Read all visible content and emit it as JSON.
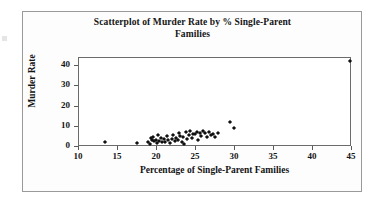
{
  "figure": {
    "background_color": "#ffffff",
    "frame_color": "#9a9a9a",
    "marker_color": "#111111"
  },
  "chart_data": {
    "type": "scatter",
    "title": "Scatterplot of Murder Rate by % Single-Parent Families",
    "title_line1": "Scatterplot of Murder Rate by % Single-Parent",
    "title_line2": "Families",
    "xlabel": "Percentage of Single-Parent Families",
    "ylabel": "Murder Rate",
    "xlim": [
      10,
      45
    ],
    "ylim": [
      0,
      44
    ],
    "xticks": [
      10,
      15,
      20,
      25,
      30,
      35,
      40,
      45
    ],
    "xtick_labels": [
      "10",
      "15",
      "20",
      "25",
      "30",
      "35",
      "40",
      "45"
    ],
    "yticks": [
      0,
      10,
      20,
      30,
      40
    ],
    "ytick_labels": [
      "0",
      "10",
      "20",
      "30",
      "40"
    ],
    "grid": false,
    "legend": false,
    "marker": "diamond",
    "n_points": 51,
    "points": [
      {
        "x": 13.5,
        "y": 1.8
      },
      {
        "x": 17.6,
        "y": 1.3
      },
      {
        "x": 19.0,
        "y": 2.0
      },
      {
        "x": 19.2,
        "y": 1.0
      },
      {
        "x": 19.3,
        "y": 3.8
      },
      {
        "x": 19.5,
        "y": 2.9
      },
      {
        "x": 19.6,
        "y": 4.4
      },
      {
        "x": 19.8,
        "y": 2.3
      },
      {
        "x": 20.0,
        "y": 3.1
      },
      {
        "x": 20.1,
        "y": 1.6
      },
      {
        "x": 20.3,
        "y": 5.6
      },
      {
        "x": 20.4,
        "y": 2.6
      },
      {
        "x": 20.6,
        "y": 4.0
      },
      {
        "x": 20.8,
        "y": 1.9
      },
      {
        "x": 21.0,
        "y": 3.4
      },
      {
        "x": 21.2,
        "y": 2.2
      },
      {
        "x": 21.4,
        "y": 4.8
      },
      {
        "x": 21.6,
        "y": 2.8
      },
      {
        "x": 21.8,
        "y": 1.7
      },
      {
        "x": 22.0,
        "y": 3.6
      },
      {
        "x": 22.2,
        "y": 5.2
      },
      {
        "x": 22.4,
        "y": 2.4
      },
      {
        "x": 22.6,
        "y": 4.2
      },
      {
        "x": 22.8,
        "y": 3.0
      },
      {
        "x": 23.0,
        "y": 6.2
      },
      {
        "x": 23.1,
        "y": 5.0
      },
      {
        "x": 23.3,
        "y": 2.1
      },
      {
        "x": 23.5,
        "y": 4.6
      },
      {
        "x": 23.6,
        "y": 1.2
      },
      {
        "x": 23.8,
        "y": 6.8
      },
      {
        "x": 24.0,
        "y": 3.3
      },
      {
        "x": 24.2,
        "y": 5.4
      },
      {
        "x": 24.4,
        "y": 7.4
      },
      {
        "x": 24.6,
        "y": 4.1
      },
      {
        "x": 24.8,
        "y": 6.0
      },
      {
        "x": 25.0,
        "y": 5.8
      },
      {
        "x": 25.2,
        "y": 7.0
      },
      {
        "x": 25.4,
        "y": 3.2
      },
      {
        "x": 25.6,
        "y": 6.4
      },
      {
        "x": 25.8,
        "y": 5.1
      },
      {
        "x": 26.0,
        "y": 7.2
      },
      {
        "x": 26.3,
        "y": 6.6
      },
      {
        "x": 26.5,
        "y": 4.3
      },
      {
        "x": 26.8,
        "y": 6.9
      },
      {
        "x": 27.0,
        "y": 5.5
      },
      {
        "x": 27.3,
        "y": 6.1
      },
      {
        "x": 27.6,
        "y": 4.5
      },
      {
        "x": 28.0,
        "y": 6.5
      },
      {
        "x": 29.5,
        "y": 12.0
      },
      {
        "x": 30.0,
        "y": 8.7
      },
      {
        "x": 44.9,
        "y": 41.8
      }
    ]
  }
}
